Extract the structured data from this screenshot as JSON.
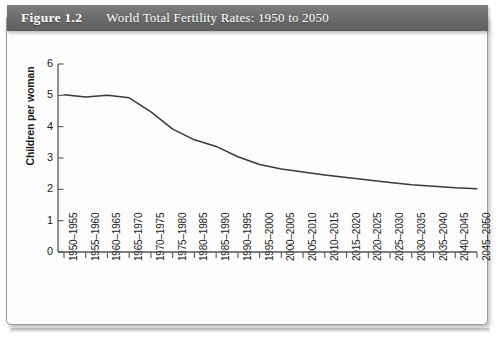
{
  "figure": {
    "number": "Figure 1.2",
    "title": "World Total Fertility Rates: 1950 to 2050"
  },
  "colors": {
    "header_bar": "#6d6d6d",
    "header_text": "#ffffff",
    "line": "#3a3a3a",
    "axis": "#555555",
    "card_border": "#9a9a9a",
    "card_background": "#fdfdfd"
  },
  "chart_data": {
    "type": "line",
    "title": "World Total Fertility Rates: 1950 to 2050",
    "xlabel": "",
    "ylabel": "Children per woman",
    "ylim": [
      0,
      6
    ],
    "yticks": [
      "0",
      "1",
      "2",
      "3",
      "4",
      "5",
      "6"
    ],
    "grid": false,
    "legend": "none",
    "categories": [
      "1950–1955",
      "1955–1960",
      "1960–1965",
      "1965–1970",
      "1970–1975",
      "1975–1980",
      "1980–1985",
      "1985–1990",
      "1990–1995",
      "1995–2000",
      "2000–2005",
      "2005–2010",
      "2010–2015",
      "2015–2020",
      "2020–2025",
      "2025–2030",
      "2030–2035",
      "2035–2040",
      "2040–2045",
      "2045–2050"
    ],
    "values": [
      5.02,
      4.95,
      5.0,
      4.92,
      4.47,
      3.92,
      3.58,
      3.37,
      3.04,
      2.79,
      2.65,
      2.55,
      2.46,
      2.38,
      2.3,
      2.22,
      2.15,
      2.1,
      2.05,
      2.02
    ]
  }
}
